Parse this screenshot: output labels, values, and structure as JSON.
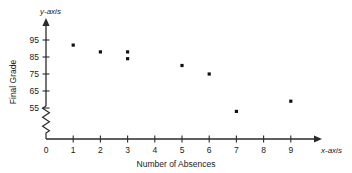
{
  "chart_data": {
    "type": "scatter",
    "title": "",
    "xlabel": "Number of Absences",
    "ylabel": "Final Grade",
    "x_axis_name": "x-axis",
    "y_axis_name": "y-axis",
    "xlim": [
      0,
      9
    ],
    "ylim": [
      50,
      100
    ],
    "x_ticks": [
      0,
      1,
      2,
      3,
      4,
      5,
      6,
      7,
      8,
      9
    ],
    "x_tick_labels": [
      "0",
      "1",
      "2",
      "3",
      "4",
      "5",
      "6",
      "7",
      "8",
      "9"
    ],
    "y_ticks": [
      55,
      65,
      75,
      85,
      95
    ],
    "y_tick_labels": [
      "55",
      "65",
      "75",
      "85",
      "95"
    ],
    "grid": false,
    "legend": false,
    "y_axis_break": true,
    "marker": "square",
    "marker_color": "#111111",
    "points": [
      {
        "x": 1,
        "y": 92
      },
      {
        "x": 2,
        "y": 88
      },
      {
        "x": 3,
        "y": 88
      },
      {
        "x": 3,
        "y": 84
      },
      {
        "x": 5,
        "y": 80
      },
      {
        "x": 6,
        "y": 75
      },
      {
        "x": 7,
        "y": 53
      },
      {
        "x": 9,
        "y": 59
      }
    ]
  }
}
